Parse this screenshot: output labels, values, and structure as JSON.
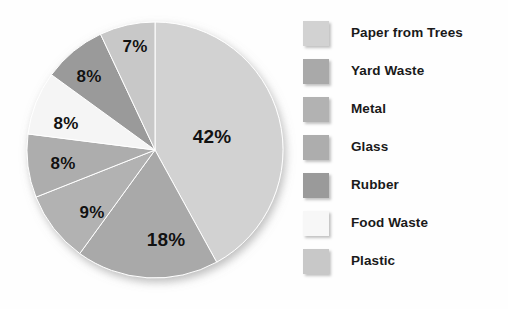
{
  "chart_data": {
    "type": "pie",
    "title": "",
    "subtitle": "",
    "xlabel": "",
    "ylabel": "",
    "grid": false,
    "legend_position": "right",
    "units": "percent",
    "start_angle_deg": 0,
    "direction": "clockwise",
    "categories": [
      "Paper from Trees",
      "Yard Waste",
      "Metal",
      "Glass",
      "Rubber",
      "Food Waste",
      "Plastic"
    ],
    "values": [
      42,
      18,
      9,
      8,
      8,
      8,
      7
    ],
    "data_labels": [
      "42%",
      "18%",
      "9%",
      "8%",
      "8%",
      "8%",
      "7%"
    ],
    "colors": [
      "#d2d2d2",
      "#a9a9a9",
      "#b2b2b2",
      "#adadad",
      "#9a9a9a",
      "#f5f5f5",
      "#c8c8c8"
    ],
    "slices": [
      {
        "label": "Paper from Trees",
        "value": 42,
        "data_label": "42%",
        "color": "#d2d2d2",
        "label_x": 212,
        "label_y": 137
      },
      {
        "label": "Yard Waste",
        "value": 18,
        "data_label": "18%",
        "color": "#a9a9a9",
        "label_x": 166,
        "label_y": 240
      },
      {
        "label": "Metal",
        "value": 9,
        "data_label": "9%",
        "color": "#b2b2b2",
        "label_x": 92,
        "label_y": 213
      },
      {
        "label": "Glass",
        "value": 8,
        "data_label": "8%",
        "color": "#adadad",
        "label_x": 63,
        "label_y": 164
      },
      {
        "label": "Food Waste",
        "value": 8,
        "data_label": "8%",
        "color": "#f5f5f5",
        "label_x": 66,
        "label_y": 124
      },
      {
        "label": "Rubber",
        "value": 8,
        "data_label": "8%",
        "color": "#9a9a9a",
        "label_x": 89,
        "label_y": 77
      },
      {
        "label": "Plastic",
        "value": 7,
        "data_label": "7%",
        "color": "#c8c8c8",
        "label_x": 135,
        "label_y": 47
      }
    ],
    "geometry": {
      "center_x": 155,
      "center_y": 150,
      "radius": 128
    }
  },
  "legend": {
    "items": [
      {
        "label": "Paper from Trees",
        "color": "#d2d2d2"
      },
      {
        "label": "Yard Waste",
        "color": "#a9a9a9"
      },
      {
        "label": "Metal",
        "color": "#b2b2b2"
      },
      {
        "label": "Glass",
        "color": "#adadad"
      },
      {
        "label": "Rubber",
        "color": "#9a9a9a"
      },
      {
        "label": "Food Waste",
        "color": "#f7f7f7"
      },
      {
        "label": "Plastic",
        "color": "#c8c8c8"
      }
    ]
  }
}
